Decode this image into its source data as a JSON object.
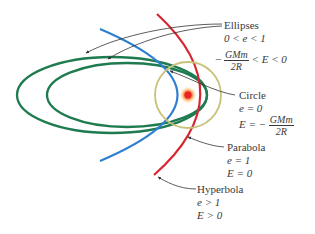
{
  "diagram": {
    "colors": {
      "ellipse": "#1e7a4f",
      "circle": "#c8c27a",
      "parabola": "#2f7fd1",
      "hyperbola": "#d8252f",
      "sun_core": "#e8251e",
      "sun_glow": "#ffd27a",
      "leader": "#333333"
    },
    "labels": {
      "ellipses": {
        "name": "Ellipses",
        "ecc": "0 < e < 1",
        "energy_prefix": "−",
        "energy_num": "GMm",
        "energy_den": "2R",
        "energy_suffix": "< E < 0"
      },
      "circle": {
        "name": "Circle",
        "ecc": "e = 0",
        "energy_prefix": "E = −",
        "energy_num": "GMm",
        "energy_den": "2R"
      },
      "parabola": {
        "name": "Parabola",
        "ecc": "e = 1",
        "energy": "E = 0"
      },
      "hyperbola": {
        "name": "Hyperbola",
        "ecc": "e > 1",
        "energy": "E > 0"
      }
    }
  }
}
